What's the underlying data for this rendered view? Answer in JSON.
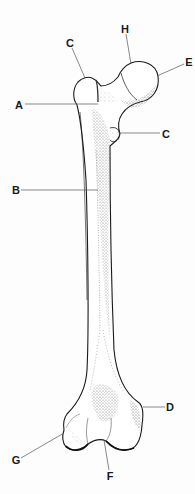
{
  "figure": {
    "labels": [
      {
        "id": "C_top",
        "text": "C",
        "x": 70,
        "y": 43
      },
      {
        "id": "H",
        "text": "H",
        "x": 125,
        "y": 29
      },
      {
        "id": "E",
        "text": "E",
        "x": 189,
        "y": 62
      },
      {
        "id": "A",
        "text": "A",
        "x": 19,
        "y": 105
      },
      {
        "id": "C_right",
        "text": "C",
        "x": 166,
        "y": 134
      },
      {
        "id": "B",
        "text": "B",
        "x": 16,
        "y": 190
      },
      {
        "id": "D",
        "text": "D",
        "x": 170,
        "y": 407
      },
      {
        "id": "G",
        "text": "G",
        "x": 16,
        "y": 460
      },
      {
        "id": "F",
        "text": "F",
        "x": 110,
        "y": 476
      }
    ],
    "colors": {
      "background": "#ffffff",
      "ink": "#1a1a1a",
      "leader": "#555555",
      "stipple": "#777777"
    }
  }
}
